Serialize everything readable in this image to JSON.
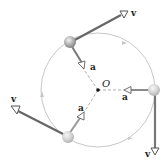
{
  "diagram": {
    "center_label": "O",
    "velocity_label": "v",
    "acceleration_label": "a",
    "colors": {
      "circle": "#c8c8c8",
      "vector": "#6e6e6e",
      "ball": "#9e9e9e",
      "dashed": "#999999"
    },
    "labels": {
      "v_top": "v",
      "v_left": "v",
      "v_right": "v",
      "a_top": "a",
      "a_left": "a",
      "a_right": "a",
      "origin": "O"
    }
  }
}
